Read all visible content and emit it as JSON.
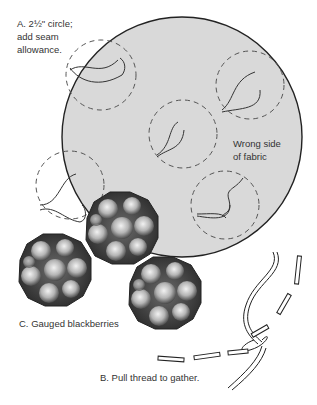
{
  "labels": {
    "a": "A. 2½\" circle;\nadd seam\nallowance.",
    "fabric": "Wrong side\nof fabric",
    "c": "C. Gauged blackberries",
    "b": "B. Pull thread to gather."
  },
  "colors": {
    "fabric_fill": "#d9d9d9",
    "outline": "#222222",
    "dash": "#555555",
    "berry_dark": "#3a3a3a",
    "berry_light": "#e8e8e8",
    "text": "#333333"
  },
  "fabric_circle": {
    "cx": 182,
    "cy": 137,
    "r": 120
  },
  "dashed_circles": [
    {
      "cx": 101,
      "cy": 75,
      "r": 35
    },
    {
      "cx": 250,
      "cy": 85,
      "r": 34
    },
    {
      "cx": 183,
      "cy": 134,
      "r": 34
    },
    {
      "cx": 70,
      "cy": 185,
      "r": 34
    },
    {
      "cx": 225,
      "cy": 205,
      "r": 34
    }
  ],
  "berries": [
    {
      "cx": 122,
      "cy": 228,
      "r": 37
    },
    {
      "cx": 55,
      "cy": 270,
      "r": 37
    },
    {
      "cx": 165,
      "cy": 293,
      "r": 37
    }
  ]
}
